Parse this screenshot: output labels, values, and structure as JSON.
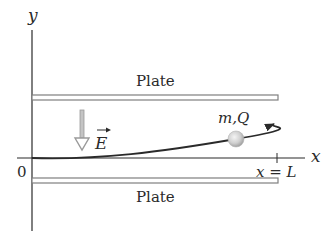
{
  "diagram": {
    "axes": {
      "x_label": "x",
      "y_label": "y",
      "origin_label": "0",
      "end_marker_label": "x = L"
    },
    "plates": {
      "top_label": "Plate",
      "bottom_label": "Plate"
    },
    "field": {
      "label": "E",
      "direction": "down"
    },
    "particle": {
      "label": "m,Q"
    },
    "colors": {
      "line": "#2a2a2a",
      "plate_fill": "#ffffff",
      "plate_stroke": "#8a8a8a",
      "field_arrow": "#9a9a9a",
      "ball_light": "#f2f2f2",
      "ball_dark": "#a8a8a8"
    }
  }
}
